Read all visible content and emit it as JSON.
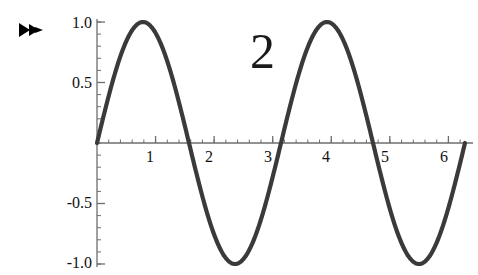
{
  "figure": {
    "background_color": "#ffffff",
    "curve_color": "#3a3a3a",
    "axis_color": "#6e6e6e",
    "text_color": "#111111",
    "annotation": "2",
    "annotation_color": "#1a1a1a"
  },
  "corner_marker": {
    "icon": "fast-forward-icon",
    "color": "#000000"
  },
  "chart_data": {
    "type": "line",
    "title": "",
    "xlabel": "",
    "ylabel": "",
    "expression": "sin(2 x)",
    "annotations": [
      {
        "text": "2",
        "x": 2.95,
        "y": 0.78
      }
    ],
    "xlim": [
      0,
      6.283185
    ],
    "ylim": [
      -1,
      1
    ],
    "grid": false,
    "legend": null,
    "x_ticks": [
      {
        "value": 1,
        "label": "1"
      },
      {
        "value": 2,
        "label": "2"
      },
      {
        "value": 3,
        "label": "3"
      },
      {
        "value": 4,
        "label": "4"
      },
      {
        "value": 5,
        "label": "5"
      },
      {
        "value": 6,
        "label": "6"
      }
    ],
    "y_ticks": [
      {
        "value": 1.0,
        "label": "1.0"
      },
      {
        "value": 0.5,
        "label": "0.5"
      },
      {
        "value": -0.5,
        "label": "-0.5"
      },
      {
        "value": -1.0,
        "label": "-1.0"
      }
    ],
    "x_minor_step": 0.2,
    "y_minor_step": 0.1,
    "key_points": {
      "zeros": [
        0,
        1.5708,
        3.14159,
        4.71239,
        6.28319
      ],
      "maxima": [
        {
          "x": 0.7854,
          "y": 1.0
        },
        {
          "x": 3.92699,
          "y": 1.0
        }
      ],
      "minima": [
        {
          "x": 2.35619,
          "y": -1.0
        },
        {
          "x": 5.49779,
          "y": -1.0
        }
      ]
    },
    "x": [
      0,
      0.1257,
      0.2513,
      0.377,
      0.5027,
      0.6283,
      0.754,
      0.8796,
      1.0053,
      1.131,
      1.2566,
      1.3823,
      1.508,
      1.6336,
      1.7593,
      1.885,
      2.0106,
      2.1363,
      2.2619,
      2.3876,
      2.5133,
      2.6389,
      2.7646,
      2.8903,
      3.0159,
      3.1416,
      3.2673,
      3.3929,
      3.5186,
      3.6442,
      3.7699,
      3.8956,
      4.0212,
      4.1469,
      4.2726,
      4.3982,
      4.5239,
      4.6496,
      4.7752,
      4.9009,
      5.0265,
      5.1522,
      5.2779,
      5.4035,
      5.5292,
      5.6549,
      5.7805,
      5.9062,
      6.0319,
      6.1575,
      6.2832
    ],
    "y": [
      0,
      0.249,
      0.4818,
      0.6845,
      0.8443,
      0.9511,
      0.998,
      0.9823,
      0.9048,
      0.7705,
      0.5878,
      0.3681,
      0.1253,
      -0.1253,
      -0.3681,
      -0.5878,
      -0.7705,
      -0.9048,
      -0.9823,
      -0.998,
      -0.9511,
      -0.8443,
      -0.6845,
      -0.4818,
      -0.249,
      0,
      0.249,
      0.4818,
      0.6845,
      0.8443,
      0.9511,
      0.998,
      0.9823,
      0.9048,
      0.7705,
      0.5878,
      0.3681,
      0.1253,
      -0.1253,
      -0.3681,
      -0.5878,
      -0.7705,
      -0.9048,
      -0.9823,
      -0.998,
      -0.9511,
      -0.8443,
      -0.6845,
      -0.4818,
      -0.249,
      0
    ]
  }
}
